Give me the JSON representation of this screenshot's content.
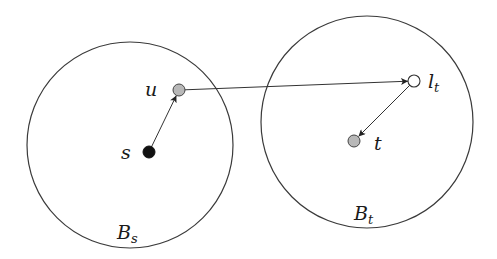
{
  "diagram": {
    "type": "graph-balls",
    "colors": {
      "stroke": "#3a3a3a",
      "source_fill": "#111111",
      "gray_fill": "#b8b8b8",
      "open_fill": "#ffffff",
      "background": "#ffffff"
    },
    "balls": [
      {
        "id": "Bs",
        "label_main": "B",
        "label_sub": "s",
        "cx": 130,
        "cy": 145,
        "r": 103,
        "label_x": 118,
        "label_y": 240
      },
      {
        "id": "Bt",
        "label_main": "B",
        "label_sub": "t",
        "cx": 367,
        "cy": 122,
        "r": 106,
        "label_x": 354,
        "label_y": 221
      }
    ],
    "nodes": [
      {
        "id": "s",
        "label": "s",
        "x": 149,
        "y": 152,
        "fill": "source_fill",
        "label_x": 122,
        "label_y": 159
      },
      {
        "id": "u",
        "label": "u",
        "x": 179,
        "y": 90,
        "fill": "gray_fill",
        "label_x": 147,
        "label_y": 96
      },
      {
        "id": "lt",
        "label_main": "l",
        "label_sub": "t",
        "x": 414,
        "y": 81,
        "fill": "open_fill",
        "label_x": 428,
        "label_y": 88
      },
      {
        "id": "t",
        "label": "t",
        "x": 354,
        "y": 141,
        "fill": "gray_fill",
        "label_x": 374,
        "label_y": 150
      }
    ],
    "edges": [
      {
        "from": "s",
        "to": "u"
      },
      {
        "from": "u",
        "to": "lt"
      },
      {
        "from": "lt",
        "to": "t"
      }
    ]
  }
}
